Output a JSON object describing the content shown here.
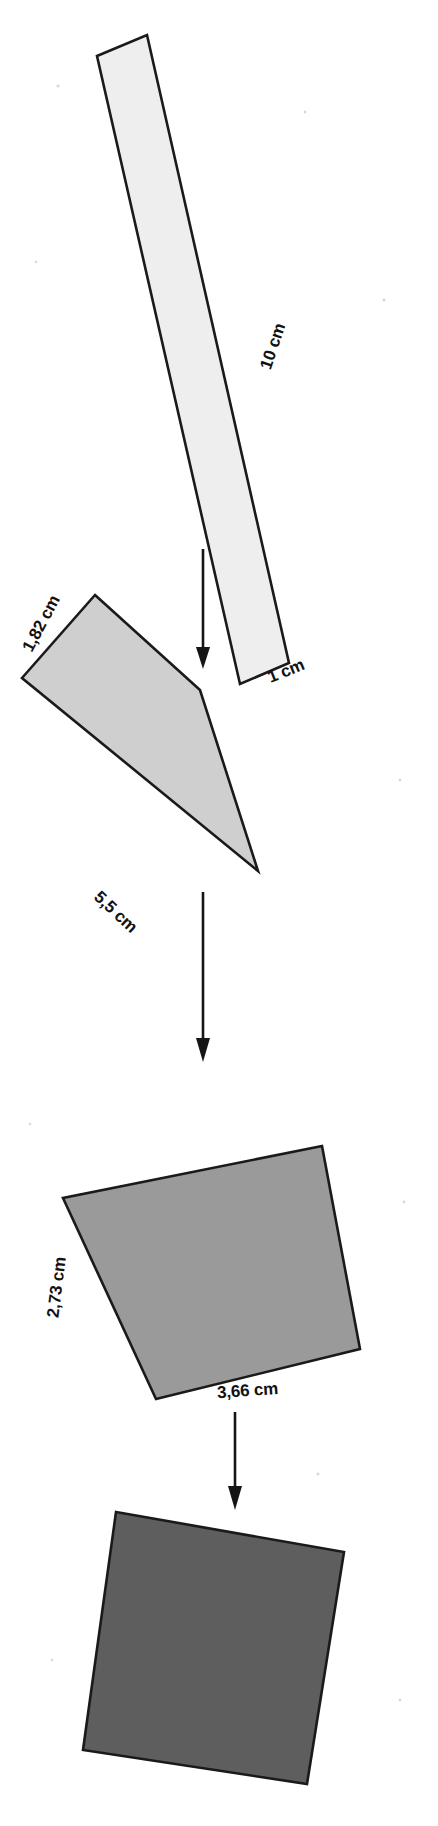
{
  "figure": {
    "background_color": "#ffffff",
    "width": 438,
    "height": 1826,
    "stroke_color": "#1a1a1a",
    "steps": [
      {
        "id": "step-1",
        "name": "strip-10x1",
        "fill": "#eeeeee",
        "labels": [
          {
            "id": "length",
            "text": "10 cm",
            "rotation": -71.5,
            "x": 278,
            "y": 348
          },
          {
            "id": "width",
            "text": "1 cm",
            "rotation": -22,
            "x": 288,
            "y": 676
          }
        ],
        "polygon": [
          [
            97,
            56
          ],
          [
            147,
            35
          ],
          [
            289,
            663
          ],
          [
            240,
            684
          ]
        ]
      },
      {
        "id": "step-2",
        "name": "rect-5_5x1_82",
        "fill": "#cfcfcf",
        "labels": [
          {
            "id": "width",
            "text": "1,82 cm",
            "rotation": -63,
            "x": 46,
            "y": 626
          },
          {
            "id": "length",
            "text": "5,5 cm",
            "rotation": 43,
            "x": 116,
            "y": 916
          }
        ],
        "polygon": [
          [
            95,
            595
          ],
          [
            200,
            690
          ],
          [
            258,
            871
          ],
          [
            22,
            678
          ]
        ]
      },
      {
        "id": "step-3",
        "name": "rect-3_66x2_73",
        "fill": "#9a9a9a",
        "labels": [
          {
            "id": "height",
            "text": "2,73 cm",
            "rotation": -83,
            "x": 64,
            "y": 1285
          },
          {
            "id": "width",
            "text": "3,66 cm",
            "rotation": -4,
            "x": 248,
            "y": 1395
          }
        ],
        "polygon": [
          [
            322,
            1146
          ],
          [
            360,
            1349
          ],
          [
            156,
            1399
          ],
          [
            63,
            1198
          ]
        ]
      },
      {
        "id": "step-4",
        "name": "square-final",
        "fill": "#5e5e5e",
        "labels": [],
        "polygon": [
          [
            116,
            1512
          ],
          [
            344,
            1552
          ],
          [
            307,
            1784
          ],
          [
            83,
            1750
          ]
        ]
      }
    ],
    "arrows": [
      {
        "id": "arrow-1",
        "name": "transform-arrow-1",
        "x": 203,
        "y1": 549,
        "y2": 667
      },
      {
        "id": "arrow-2",
        "name": "transform-arrow-2",
        "x": 235,
        "y1": 892,
        "y2": 1032
      },
      {
        "id": "arrow-3",
        "name": "transform-arrow-3",
        "x": 235,
        "y1": 1162,
        "y2": 1137
      },
      {
        "id": "arrow-4",
        "name": "transform-arrow-4",
        "x": 235,
        "y1": 1412,
        "y2": 1505
      }
    ]
  }
}
